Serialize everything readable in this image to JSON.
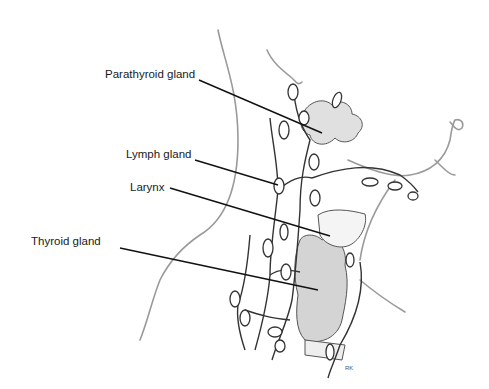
{
  "diagram": {
    "type": "anatomical-illustration",
    "labels": [
      {
        "id": "parathyroid",
        "text": "Parathyroid gland"
      },
      {
        "id": "lymph",
        "text": "Lymph gland"
      },
      {
        "id": "larynx",
        "text": "Larynx"
      },
      {
        "id": "thyroid",
        "text": "Thyroid gland"
      }
    ],
    "signature": "RK"
  }
}
